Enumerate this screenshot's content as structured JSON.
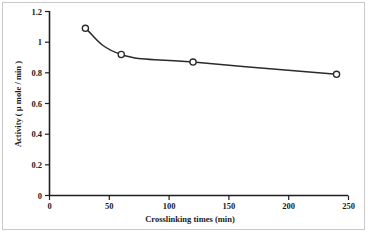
{
  "chart_data": {
    "type": "line",
    "title": "",
    "subtitle": "",
    "xlabel": "Crosslinking times (min)",
    "ylabel": "Activity ( µ mole / min )",
    "x": [
      30,
      60,
      120,
      240
    ],
    "values": [
      1.09,
      0.92,
      0.87,
      0.79
    ],
    "series": [
      {
        "name": "Activity",
        "x": [
          30,
          60,
          120,
          240
        ],
        "values": [
          1.09,
          0.92,
          0.87,
          0.79
        ]
      }
    ],
    "xlim": [
      0,
      250
    ],
    "ylim": [
      0,
      1.2
    ],
    "x_ticks": [
      0,
      50,
      100,
      150,
      200,
      250
    ],
    "x_tick_labels": [
      "0",
      "50",
      "100",
      "150",
      "200",
      "250"
    ],
    "y_ticks": [
      0,
      0.2,
      0.4,
      0.6,
      0.8,
      1,
      1.2
    ],
    "y_tick_labels": [
      "0",
      "0.2",
      "0.4",
      "0.6",
      "0.8",
      "1",
      "1.2"
    ],
    "grid": false,
    "legend": false,
    "legend_position": "none",
    "marker": "open-circle",
    "line_color": "#2a2a2a",
    "marker_face_color": "#ffffff",
    "marker_edge_color": "#2a2a2a",
    "background_color": "#ffffff",
    "border_color": "#c9c9c9",
    "annotations": []
  },
  "axis_labels": {
    "y_0": "0",
    "y_02": "0.2",
    "y_04": "0.4",
    "y_06": "0.6",
    "y_08": "0.8",
    "y_1": "1",
    "y_12": "1.2",
    "x_0": "0",
    "x_50": "50",
    "x_100": "100",
    "x_150": "150",
    "x_200": "200",
    "x_250": "250",
    "x_title": "Crosslinking times (min)",
    "y_title": "Activity ( µ mole / min )"
  }
}
